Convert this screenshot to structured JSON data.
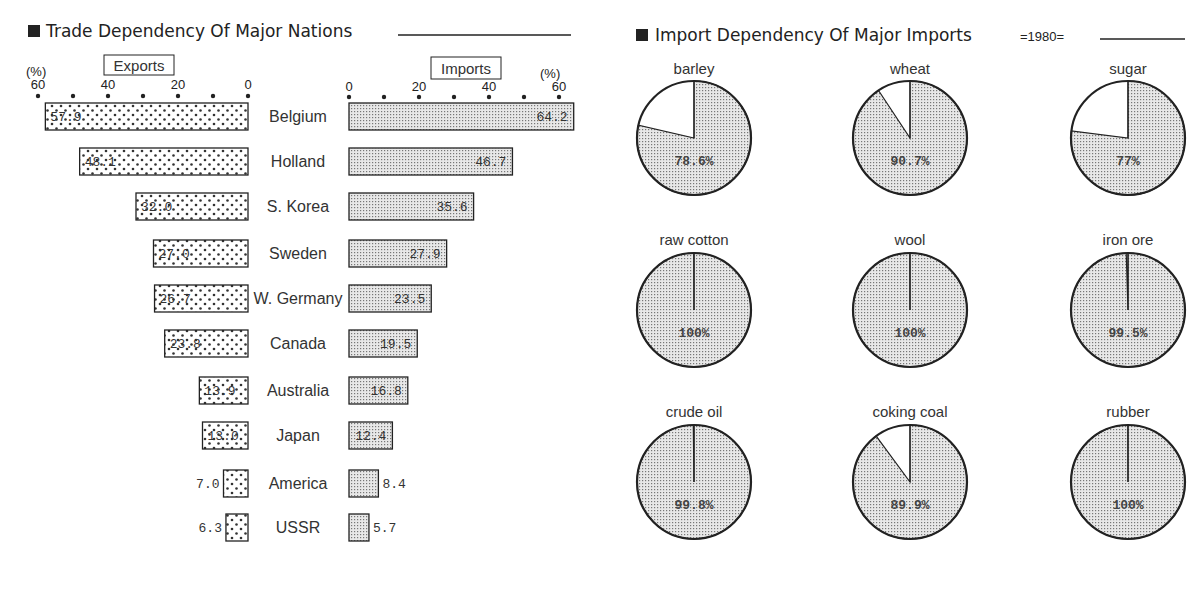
{
  "chart_data": [
    {
      "type": "bar",
      "title": "Trade Dependency Of Major Nations",
      "unit_label": "(%)",
      "layout": "back-to-back horizontal bar",
      "categories": [
        "Belgium",
        "Holland",
        "S. Korea",
        "Sweden",
        "W. Germany",
        "Canada",
        "Australia",
        "Japan",
        "America",
        "USSR"
      ],
      "series": [
        {
          "name": "Exports",
          "values": [
            57.9,
            48.1,
            32.0,
            27.0,
            26.7,
            23.8,
            13.9,
            13.0,
            7.0,
            6.3
          ],
          "labels": [
            "57.9",
            "48.1",
            "32.0",
            "27.0",
            "26.7",
            "23.8",
            "13.9",
            "13.0",
            "7.0",
            "6.3"
          ]
        },
        {
          "name": "Imports",
          "values": [
            64.2,
            46.7,
            35.6,
            27.9,
            23.5,
            19.5,
            16.8,
            12.4,
            8.4,
            5.7
          ],
          "labels": [
            "64.2",
            "46.7",
            "35.6",
            "27.9",
            "23.5",
            "19.5",
            "16.8",
            "12.4",
            "8.4",
            "5.7"
          ]
        }
      ],
      "axis_ticks": [
        "0",
        "20",
        "40",
        "60"
      ],
      "xlim": [
        0,
        60
      ]
    },
    {
      "type": "pie",
      "title": "Import Dependency Of Major Imports",
      "year_label": "=1980=",
      "items": [
        {
          "name": "barley",
          "value": 78.6,
          "label": "78.6%"
        },
        {
          "name": "wheat",
          "value": 90.7,
          "label": "90.7%"
        },
        {
          "name": "sugar",
          "value": 77,
          "label": "77%"
        },
        {
          "name": "raw cotton",
          "value": 100,
          "label": "100%"
        },
        {
          "name": "wool",
          "value": 100,
          "label": "100%"
        },
        {
          "name": "iron ore",
          "value": 99.5,
          "label": "99.5%"
        },
        {
          "name": "crude oil",
          "value": 99.8,
          "label": "99.8%"
        },
        {
          "name": "coking coal",
          "value": 89.9,
          "label": "89.9%"
        },
        {
          "name": "rubber",
          "value": 100,
          "label": "100%"
        }
      ]
    }
  ],
  "colors": {
    "ink": "#222222",
    "fill_dots": "#ffffff",
    "fill_shade": "#cfcfcf"
  }
}
